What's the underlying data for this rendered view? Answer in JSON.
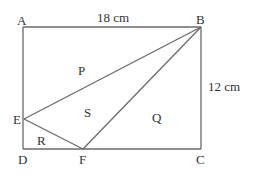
{
  "diagram": {
    "type": "geometry",
    "shape": "rectangle ABCD divided into triangles",
    "vertices": {
      "A": {
        "label": "A",
        "x": 23,
        "y": 27
      },
      "B": {
        "label": "B",
        "x": 201,
        "y": 27
      },
      "C": {
        "label": "C",
        "x": 201,
        "y": 149
      },
      "D": {
        "label": "D",
        "x": 23,
        "y": 149
      },
      "E": {
        "label": "E",
        "x": 24,
        "y": 119
      },
      "F": {
        "label": "F",
        "x": 83,
        "y": 149
      }
    },
    "segments": [
      [
        "A",
        "B"
      ],
      [
        "B",
        "C"
      ],
      [
        "C",
        "D"
      ],
      [
        "D",
        "A"
      ],
      [
        "B",
        "E"
      ],
      [
        "B",
        "F"
      ],
      [
        "E",
        "F"
      ]
    ],
    "dimensions": {
      "top": "18 cm",
      "right": "12 cm"
    },
    "regions": {
      "P": "P",
      "S": "S",
      "Q": "Q",
      "R": "R"
    },
    "line_color": "#6a6a6a",
    "text_color": "#333333"
  }
}
